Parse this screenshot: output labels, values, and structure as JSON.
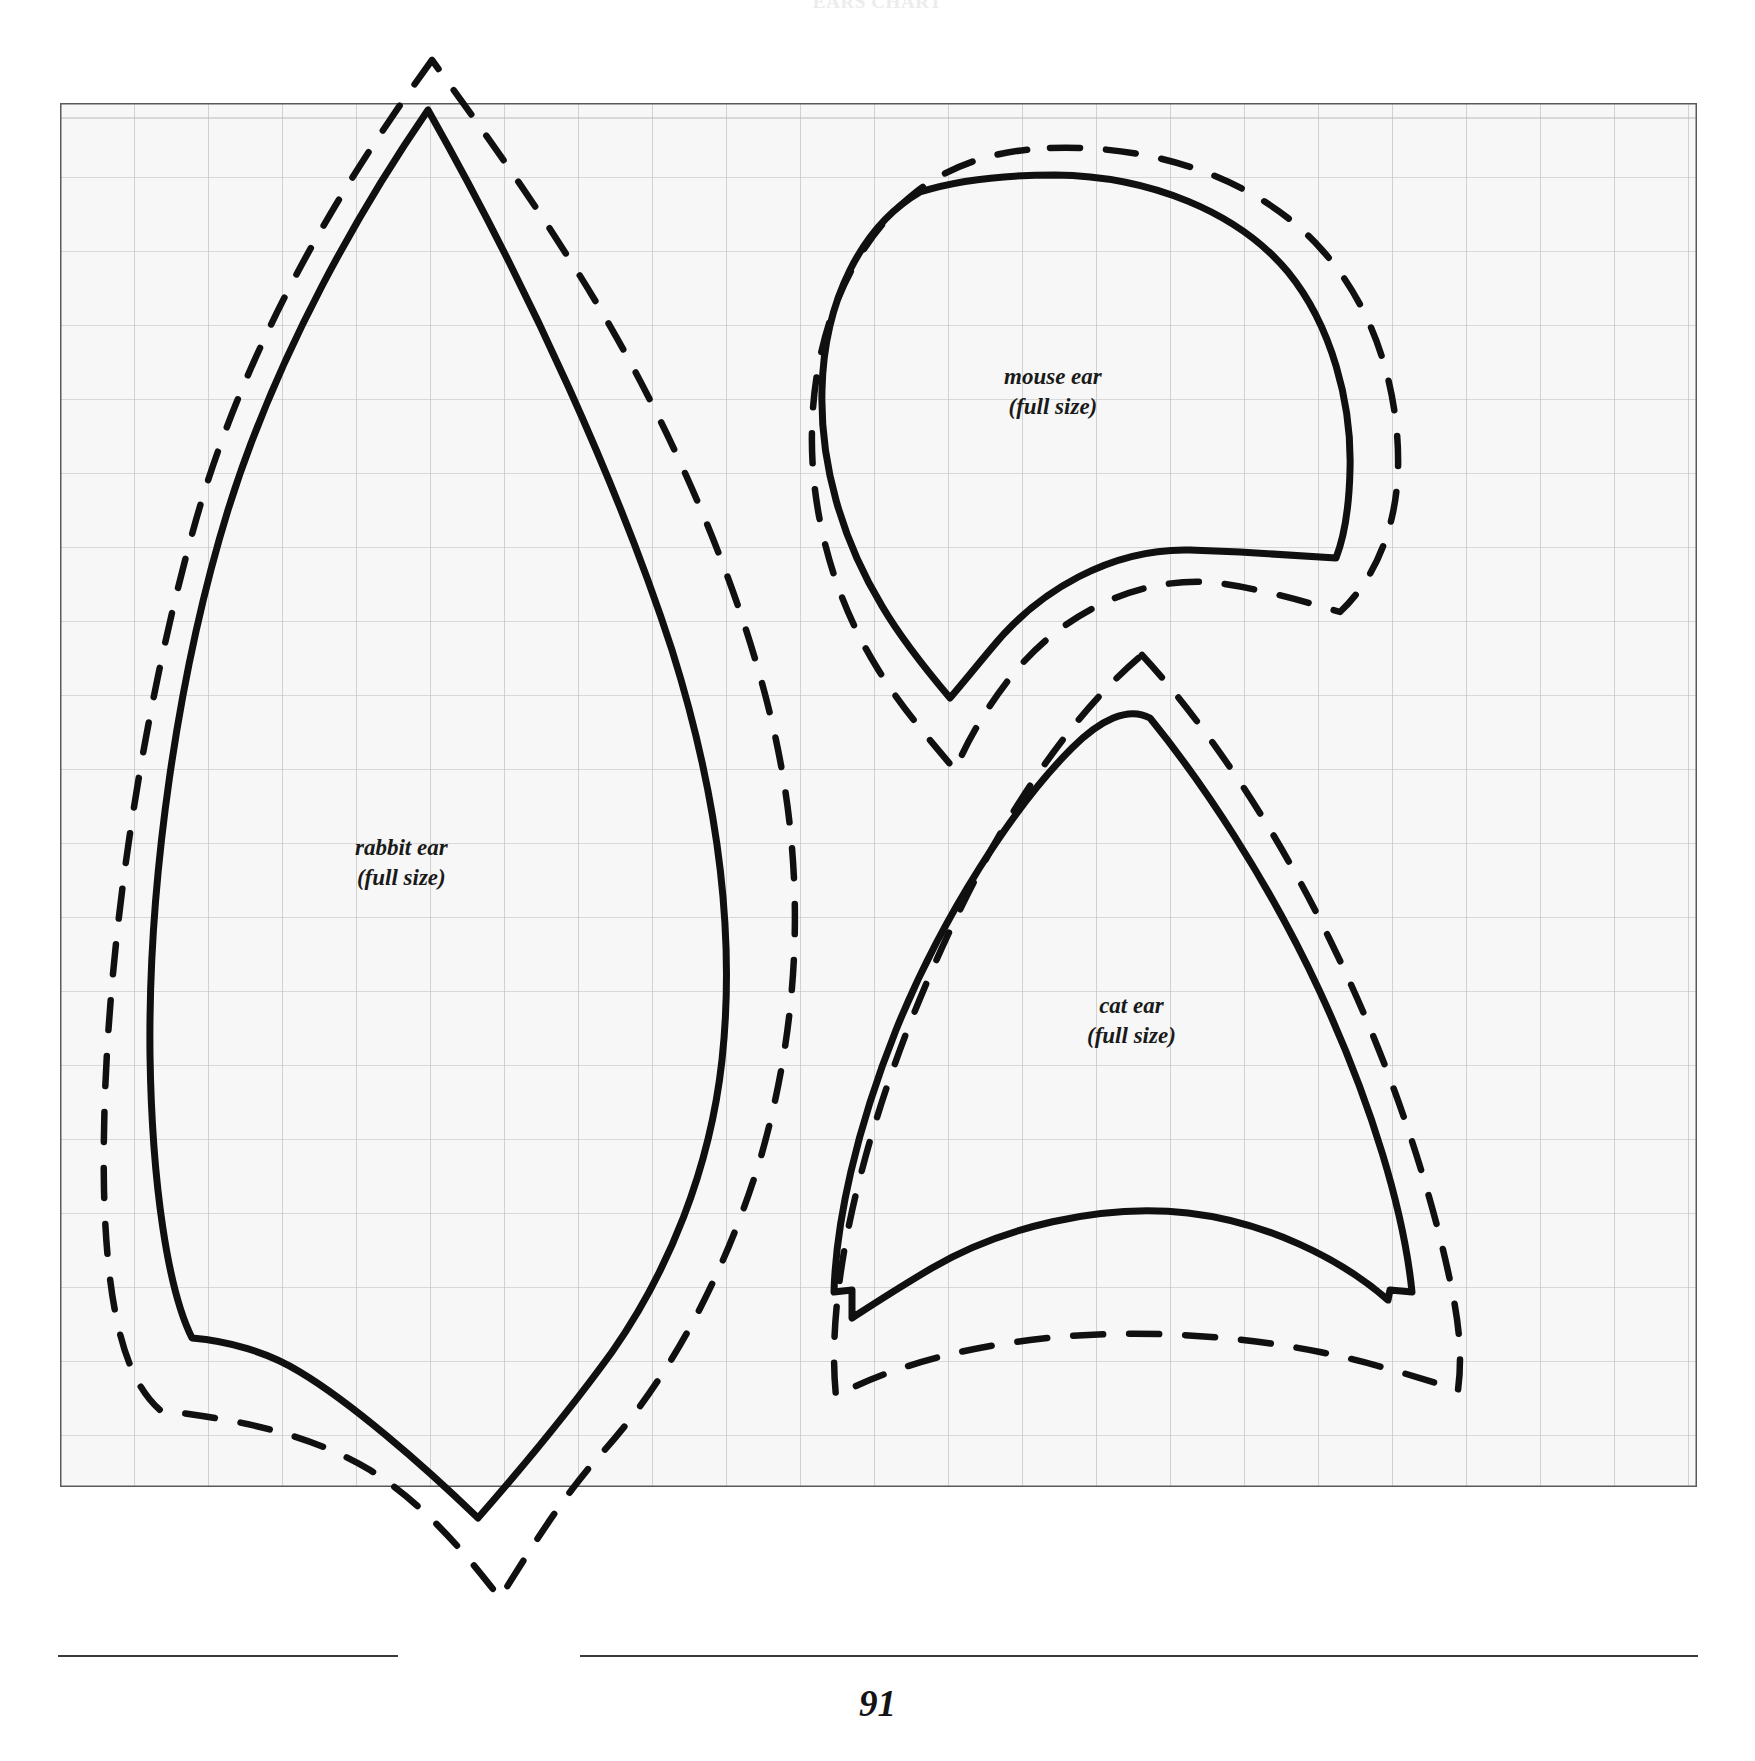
{
  "page": {
    "running_head": "EARS CHART",
    "folio": "91",
    "background_color": "#ffffff",
    "ink_color": "#101010"
  },
  "grid": {
    "name": "pattern-grid",
    "x": 60,
    "y": 103,
    "width": 1637,
    "height": 1384,
    "columns": 22,
    "rows": 19,
    "cell_size_px": 74,
    "line_color": "#b9b9b9",
    "border_color": "#5a5a5a",
    "fill_color": "#f7f7f7"
  },
  "pieces": [
    {
      "id": "rabbit-ear",
      "label_line1": "rabbit ear",
      "label_line2": "(full size)",
      "label_x": 355,
      "label_y": 833,
      "cut_line": "solid",
      "seam_line": "dashed"
    },
    {
      "id": "mouse-ear",
      "label_line1": "mouse ear",
      "label_line2": "(full size)",
      "label_x": 1004,
      "label_y": 362,
      "cut_line": "solid",
      "seam_line": "dashed"
    },
    {
      "id": "cat-ear",
      "label_line1": "cat ear",
      "label_line2": "(full size)",
      "label_x": 1087,
      "label_y": 991,
      "cut_line": "solid",
      "seam_line": "dashed"
    }
  ],
  "legend": {
    "solid_meaning": "cutting / stitching line",
    "dashed_meaning": "seam allowance"
  }
}
